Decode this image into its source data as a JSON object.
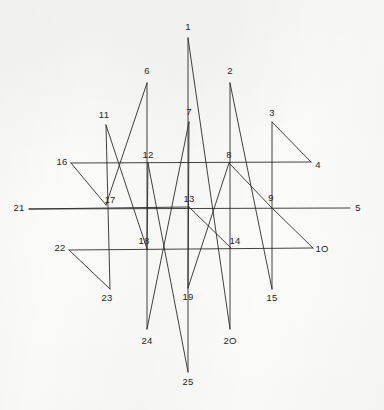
{
  "figure": {
    "background_color": "#fbfbfa",
    "stroke_color": "#2b2b2b",
    "label_color": "#262626",
    "stroke_width": 0.9,
    "width": 384,
    "height": 410
  },
  "chart_data": {
    "type": "scatter",
    "xlabel": "",
    "ylabel": "",
    "grid": false,
    "legend": null,
    "xlim": [
      0,
      384
    ],
    "ylim": [
      0,
      410
    ],
    "point_labels": [
      "1",
      "2",
      "3",
      "4",
      "5",
      "6",
      "7",
      "8",
      "9",
      "10",
      "11",
      "12",
      "13",
      "14",
      "15",
      "16",
      "17",
      "18",
      "19",
      "20",
      "21",
      "22",
      "23",
      "24",
      "25"
    ],
    "x": [
      188,
      230,
      272,
      311,
      350,
      147,
      189,
      229,
      271,
      313,
      106,
      148,
      189,
      231,
      272,
      71,
      106,
      147,
      188,
      230,
      29,
      69,
      110,
      147,
      188
    ],
    "y": [
      38,
      83,
      122,
      162,
      208,
      83,
      122,
      163,
      207,
      248,
      125,
      163,
      207,
      248,
      289,
      163,
      205,
      249,
      288,
      329,
      209,
      250,
      289,
      329,
      372
    ],
    "path_order": [
      1,
      2,
      3,
      4,
      5,
      6,
      7,
      8,
      9,
      10,
      11,
      12,
      13,
      14,
      15,
      16,
      17,
      18,
      19,
      20,
      21,
      22,
      23,
      24,
      25
    ]
  },
  "vertices": [
    {
      "id": "1",
      "label": "1",
      "x": 188,
      "y": 38,
      "label_x": 188,
      "label_y": 27
    },
    {
      "id": "2",
      "label": "2",
      "x": 230,
      "y": 83,
      "label_x": 230,
      "label_y": 71
    },
    {
      "id": "3",
      "label": "3",
      "x": 272,
      "y": 122,
      "label_x": 272,
      "label_y": 113
    },
    {
      "id": "4",
      "label": "4",
      "x": 311,
      "y": 162,
      "label_x": 318,
      "label_y": 165
    },
    {
      "id": "5",
      "label": "5",
      "x": 350,
      "y": 208,
      "label_x": 358,
      "label_y": 208
    },
    {
      "id": "6",
      "label": "6",
      "x": 147,
      "y": 83,
      "label_x": 147,
      "label_y": 71
    },
    {
      "id": "7",
      "label": "7",
      "x": 189,
      "y": 122,
      "label_x": 189,
      "label_y": 112
    },
    {
      "id": "8",
      "label": "8",
      "x": 229,
      "y": 163,
      "label_x": 229,
      "label_y": 155
    },
    {
      "id": "9",
      "label": "9",
      "x": 271,
      "y": 207,
      "label_x": 271,
      "label_y": 198
    },
    {
      "id": "10",
      "label": "1O",
      "x": 313,
      "y": 248,
      "label_x": 322,
      "label_y": 249
    },
    {
      "id": "11",
      "label": "11",
      "x": 106,
      "y": 125,
      "label_x": 104,
      "label_y": 115
    },
    {
      "id": "12",
      "label": "12",
      "x": 148,
      "y": 163,
      "label_x": 148,
      "label_y": 155
    },
    {
      "id": "13",
      "label": "13",
      "x": 189,
      "y": 207,
      "label_x": 189,
      "label_y": 199
    },
    {
      "id": "14",
      "label": "14",
      "x": 231,
      "y": 248,
      "label_x": 235,
      "label_y": 241
    },
    {
      "id": "15",
      "label": "15",
      "x": 272,
      "y": 289,
      "label_x": 272,
      "label_y": 298
    },
    {
      "id": "16",
      "label": "16",
      "x": 71,
      "y": 163,
      "label_x": 62,
      "label_y": 162
    },
    {
      "id": "17",
      "label": "17",
      "x": 106,
      "y": 205,
      "label_x": 110,
      "label_y": 200
    },
    {
      "id": "18",
      "label": "18",
      "x": 147,
      "y": 249,
      "label_x": 144,
      "label_y": 241
    },
    {
      "id": "19",
      "label": "19",
      "x": 188,
      "y": 288,
      "label_x": 188,
      "label_y": 297
    },
    {
      "id": "20",
      "label": "2O",
      "x": 230,
      "y": 329,
      "label_x": 230,
      "label_y": 341
    },
    {
      "id": "21",
      "label": "21",
      "x": 29,
      "y": 209,
      "label_x": 19,
      "label_y": 208
    },
    {
      "id": "22",
      "label": "22",
      "x": 69,
      "y": 250,
      "label_x": 60,
      "label_y": 248
    },
    {
      "id": "23",
      "label": "23",
      "x": 110,
      "y": 289,
      "label_x": 107,
      "label_y": 298
    },
    {
      "id": "24",
      "label": "24",
      "x": 147,
      "y": 329,
      "label_x": 147,
      "label_y": 341
    },
    {
      "id": "25",
      "label": "25",
      "x": 188,
      "y": 372,
      "label_x": 188,
      "label_y": 382
    }
  ],
  "edges": [
    {
      "name": "edge-25-1",
      "from": "25",
      "to": "1"
    },
    {
      "name": "edge-1-20",
      "from": "1",
      "to": "20"
    },
    {
      "name": "edge-20-2",
      "from": "20",
      "to": "2"
    },
    {
      "name": "edge-2-15",
      "from": "2",
      "to": "15"
    },
    {
      "name": "edge-15-3",
      "from": "15",
      "to": "3"
    },
    {
      "name": "edge-3-4",
      "from": "3",
      "to": "4"
    },
    {
      "name": "edge-4-16",
      "from": "4",
      "to": "16"
    },
    {
      "name": "edge-16-17",
      "from": "16",
      "to": "17"
    },
    {
      "name": "edge-17-6",
      "from": "17",
      "to": "6"
    },
    {
      "name": "edge-6-24",
      "from": "6",
      "to": "24"
    },
    {
      "name": "edge-24-7",
      "from": "24",
      "to": "7"
    },
    {
      "name": "edge-7-19",
      "from": "7",
      "to": "19"
    },
    {
      "name": "edge-19-8",
      "from": "19",
      "to": "8"
    },
    {
      "name": "edge-8-9",
      "from": "8",
      "to": "9"
    },
    {
      "name": "edge-9-10",
      "from": "9",
      "to": "10"
    },
    {
      "name": "edge-10-22",
      "from": "10",
      "to": "22"
    },
    {
      "name": "edge-22-23",
      "from": "22",
      "to": "23"
    },
    {
      "name": "edge-23-11",
      "from": "23",
      "to": "11"
    },
    {
      "name": "edge-11-18",
      "from": "11",
      "to": "18"
    },
    {
      "name": "edge-18-12",
      "from": "18",
      "to": "12"
    },
    {
      "name": "edge-12-25",
      "from": "12",
      "to": "25"
    },
    {
      "name": "edge-5-21",
      "from": "5",
      "to": "21"
    },
    {
      "name": "edge-21-13",
      "from": "21",
      "to": "13"
    },
    {
      "name": "edge-13-14",
      "from": "13",
      "to": "14"
    }
  ]
}
